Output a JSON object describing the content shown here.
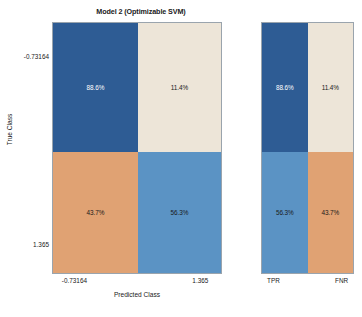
{
  "chart_data": {
    "type": "heatmap",
    "title": "Model 2 (Optimizable SVM)",
    "xlabel": "Predicted Class",
    "ylabel": "True Class",
    "categories": [
      "-0.73164",
      "1.365"
    ],
    "row_labels": [
      "-0.73164",
      "1.365"
    ],
    "column_labels": [
      "-0.73164",
      "1.365"
    ],
    "matrix_percent": [
      [
        88.6,
        11.4
      ],
      [
        43.7,
        56.3
      ]
    ],
    "cells": [
      {
        "row": 0,
        "col": 0,
        "label": "88.6%",
        "color": "#2E5C94",
        "text_color": "#FFFFFF"
      },
      {
        "row": 0,
        "col": 1,
        "label": "11.4%",
        "color": "#EDE5D8",
        "text_color": "#1A1A1A"
      },
      {
        "row": 1,
        "col": 0,
        "label": "43.7%",
        "color": "#E0A273",
        "text_color": "#1A1A1A"
      },
      {
        "row": 1,
        "col": 1,
        "label": "56.3%",
        "color": "#5B93C4",
        "text_color": "#1A1A1A"
      }
    ],
    "side_panel": {
      "column_labels": [
        "TPR",
        "FNR"
      ],
      "values": [
        [
          88.6,
          11.4
        ],
        [
          56.3,
          43.7
        ]
      ],
      "cells": [
        {
          "row": 0,
          "col": 0,
          "label": "88.6%",
          "color": "#2E5C94",
          "text_color": "#FFFFFF"
        },
        {
          "row": 0,
          "col": 1,
          "label": "11.4%",
          "color": "#EDE5D8",
          "text_color": "#1A1A1A"
        },
        {
          "row": 1,
          "col": 0,
          "label": "56.3%",
          "color": "#5B93C4",
          "text_color": "#1A1A1A"
        },
        {
          "row": 1,
          "col": 1,
          "label": "43.7%",
          "color": "#E0A273",
          "text_color": "#1A1A1A"
        }
      ]
    },
    "legend": null,
    "grid": false,
    "colors": {
      "dark_blue": "#2E5C94",
      "light_blue": "#5B93C4",
      "cream": "#EDE5D8",
      "orange": "#E0A273",
      "border": "#9AA4AD",
      "background": "#FFFFFF",
      "text": "#1A1A1A"
    }
  }
}
